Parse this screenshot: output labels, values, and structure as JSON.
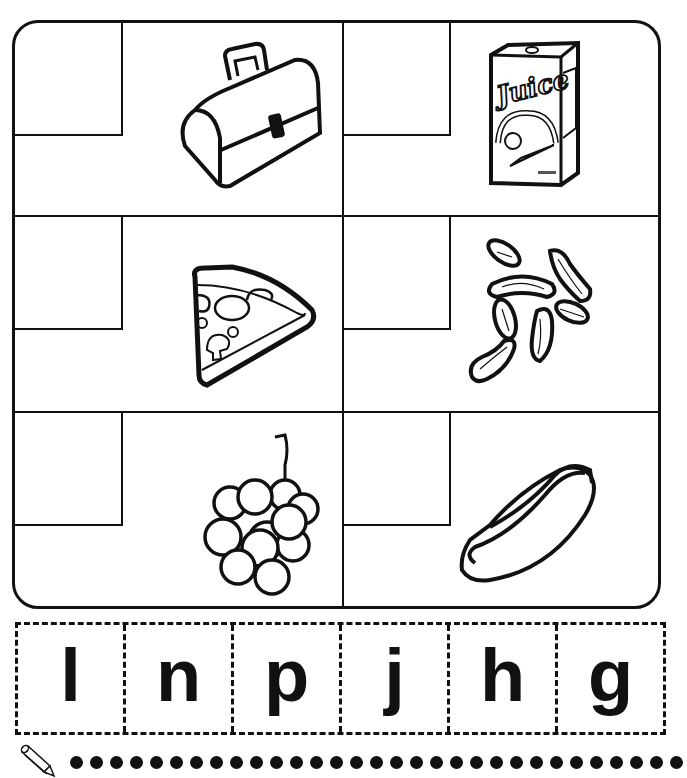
{
  "worksheet": {
    "title": "Initial sounds match - lunch foods",
    "cells": [
      {
        "id": "lunchbox",
        "picture": "lunchbox-icon",
        "label": "lunchbox",
        "answer": ""
      },
      {
        "id": "juice",
        "picture": "juice-box-icon",
        "label": "juice",
        "answer": "",
        "printed_text": "Juice"
      },
      {
        "id": "pizza",
        "picture": "pizza-slice-icon",
        "label": "pizza",
        "answer": ""
      },
      {
        "id": "nuts",
        "picture": "peanuts-icon",
        "label": "nuts",
        "answer": ""
      },
      {
        "id": "grapes",
        "picture": "grapes-icon",
        "label": "grapes",
        "answer": ""
      },
      {
        "id": "hotdog",
        "picture": "hot-dog-icon",
        "label": "hot dog",
        "answer": ""
      }
    ]
  },
  "letter_tiles": [
    "l",
    "n",
    "p",
    "j",
    "h",
    "g"
  ],
  "writing_line": {
    "icon": "pencil-icon",
    "dot_count": 31
  }
}
